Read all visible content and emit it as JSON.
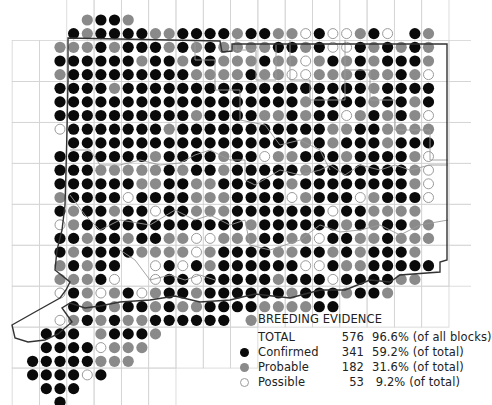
{
  "colors": {
    "confirmed": "#0a0a0a",
    "probable": "#8a8a8a",
    "possible_fill": "#ffffff",
    "possible_stroke": "#9a9a9a",
    "grid": "#d4d4d4",
    "border": "#333333",
    "county": "#9a9a9a"
  },
  "legend": {
    "title": "BREEDING EVIDENCE",
    "rows": [
      {
        "key": "total",
        "label": "TOTAL",
        "count": "576",
        "pct": "96.6% (of all blocks)"
      },
      {
        "key": "confirmed",
        "label": "Confirmed",
        "count": "341",
        "pct": "59.2% (of total)"
      },
      {
        "key": "probable",
        "label": "Probable",
        "count": "182",
        "pct": "31.6% (of total)"
      },
      {
        "key": "possible",
        "label": "Possible",
        "count": "53",
        "pct": " 9.2% (of total)"
      }
    ]
  },
  "map": {
    "origin_x": 19,
    "origin_y": 20,
    "pitch_x": 13.65,
    "pitch_y": 13.65,
    "dot_radius": 5.6,
    "rows": [
      ".....PCCP.......................",
      "....CPCCCCPPCCCCPCCPPOCOOPCO.CP.",
      "...PPPCPCCCPCPCPPPPCCPCOOCPCPCP.",
      "...CCCCCCPCCPCCPPPCPPOPCPCPCCCP.",
      "...PCCCCCCCCCPPPPCPPOOPPPCPPCPO.",
      "...CCCCPCCCCCCCCCCCCCCCCCCPCCCC.",
      "...CCCCCCCCCCCCCCCCCCPCCCCPCCPC.",
      "...CCCCCCCCCCPCCCCPPCPCCOPCPCPO.",
      "...OCCCCCCCPCCCCCCCCCCCPPCCPPPP.",
      "....CCCCCCCCCCCCCCCCCPCPCCCPCCC.",
      "...CCCCCCCPCCCCPCCOPPCCCPCCCCPO.",
      "...CCCPPPPPCPCCPCCCCCPCCCCCCCPO.",
      "...CCCCCCPPCCPPCCCCCPCCCCCCCCPO.",
      "...PCCCCOCCCCPPPCCCCOPCCCOPCCCO.",
      "...CPCCPCCOCCPPPCCCCCCCOCCPPPP..",
      "...OPCCCCCCCCCCCCPCCCCCCPCPCCPP.",
      "...CCPCCPCCPPOOPPPCCPPOCCPPCPPP.",
      "...CPCCCCPPPPOPCCCCPPCCPCPCCCP..",
      "...PCPCC..OCOCPCCCCCCOOCPPCCCCC.",
      "...PPPCO..OCCOCCCCCPCCCOCCCCPP..",
      "...OCPOPCOPCCPCCCCCCPCCCPCCP....",
      "....CPCPCCPCPPCCCCPPPPCC........",
      "...OPCPCPPCCCCCC.P..............",
      "..CCC.PCCCP.....................",
      "..CCCCOPPP......................",
      ".CCCCCPPP.......................",
      ".CCCCOC.........................",
      "..CCC...........................",
      "...C............................"
    ]
  }
}
